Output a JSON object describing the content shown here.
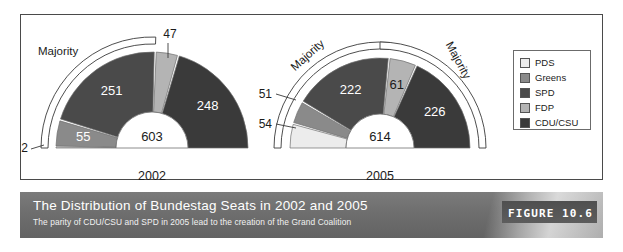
{
  "figure": {
    "caption_title": "The Distribution of Bundestag Seats in 2002 and 2005",
    "caption_subtitle": "The parity of CDU/CSU and SPD in 2005 lead to the creation of the Grand Coalition",
    "badge": "FIGURE 10.6"
  },
  "legend": {
    "items": [
      {
        "label": "PDS",
        "color": "#ececec"
      },
      {
        "label": "Greens",
        "color": "#8a8a8a"
      },
      {
        "label": "SPD",
        "color": "#4a4a4a"
      },
      {
        "label": "FDP",
        "color": "#b4b4b4"
      },
      {
        "label": "CDU/CSU",
        "color": "#3a3a3a"
      }
    ]
  },
  "labels": {
    "majority": "Majority",
    "majority_right": "Majority",
    "majority_2002": "Majority"
  },
  "chart_data": {
    "type": "pie",
    "title": "The Distribution of Bundestag Seats in 2002 and 2005",
    "subtitle": "The parity of CDU/CSU and SPD in 2005 lead to the creation of the Grand Coalition",
    "variant": "half-donut (semicircular parliament diagram)",
    "legend_position": "right",
    "grid": false,
    "categories": [
      "PDS",
      "Greens",
      "SPD",
      "FDP",
      "CDU/CSU"
    ],
    "colors": [
      "#ececec",
      "#8a8a8a",
      "#4a4a4a",
      "#b4b4b4",
      "#3a3a3a"
    ],
    "charts": [
      {
        "name": "2002",
        "year_label": "2002",
        "total": 603,
        "total_label": "603",
        "majority_labels": [
          "Majority"
        ],
        "values": [
          2,
          55,
          251,
          47,
          248
        ],
        "value_labels": [
          "2",
          "55",
          "251",
          "47",
          "248"
        ],
        "series": [
          {
            "name": "PDS",
            "value": 2,
            "label": "2",
            "label_style": "callout-left"
          },
          {
            "name": "Greens",
            "value": 55,
            "label": "55",
            "label_style": "inside-light"
          },
          {
            "name": "SPD",
            "value": 251,
            "label": "251",
            "label_style": "inside-light"
          },
          {
            "name": "FDP",
            "value": 47,
            "label": "47",
            "label_style": "callout-top"
          },
          {
            "name": "CDU/CSU",
            "value": 248,
            "label": "248",
            "label_style": "inside-light"
          }
        ]
      },
      {
        "name": "2005",
        "year_label": "2005",
        "total": 614,
        "total_label": "614",
        "majority_labels": [
          "Majority",
          "Majority"
        ],
        "values": [
          54,
          51,
          222,
          61,
          226
        ],
        "value_labels": [
          "54",
          "51",
          "222",
          "61",
          "226"
        ],
        "series": [
          {
            "name": "PDS",
            "value": 54,
            "label": "54",
            "label_style": "callout-left"
          },
          {
            "name": "Greens",
            "value": 51,
            "label": "51",
            "label_style": "callout-left"
          },
          {
            "name": "SPD",
            "value": 222,
            "label": "222",
            "label_style": "inside-light"
          },
          {
            "name": "FDP",
            "value": 61,
            "label": "61",
            "label_style": "inside-dark"
          },
          {
            "name": "CDU/CSU",
            "value": 226,
            "label": "226",
            "label_style": "inside-light"
          }
        ]
      }
    ]
  }
}
